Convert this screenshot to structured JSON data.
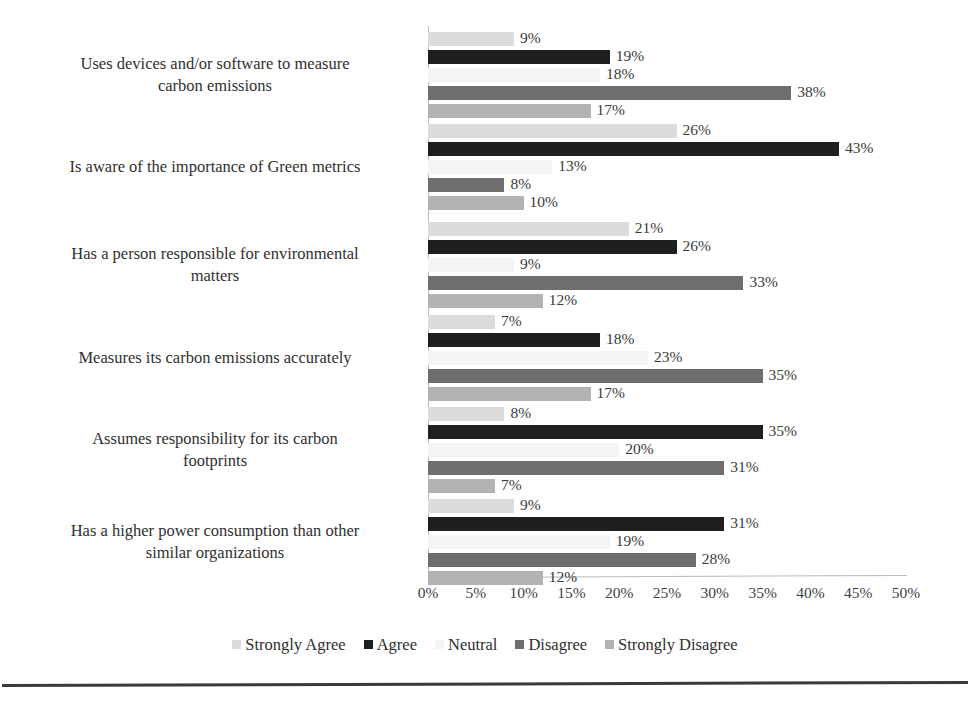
{
  "chart_data": {
    "type": "bar",
    "orientation": "horizontal",
    "title": "",
    "subtitle": "",
    "xlabel": "",
    "ylabel": "",
    "xlim": [
      0,
      50
    ],
    "xtick_labels": [
      "0%",
      "5%",
      "10%",
      "15%",
      "20%",
      "25%",
      "30%",
      "35%",
      "40%",
      "45%",
      "50%"
    ],
    "xtick_values": [
      0,
      5,
      10,
      15,
      20,
      25,
      30,
      35,
      40,
      45,
      50
    ],
    "grid": false,
    "legend_position": "bottom",
    "value_label_suffix": "%",
    "categories": [
      "Uses devices and/or software to measure carbon emissions",
      "Is aware of the importance of Green metrics",
      "Has a person responsible for environmental matters",
      "Measures its carbon emissions accurately",
      "Assumes responsibility for its carbon footprints",
      "Has a higher power consumption than other similar organizations"
    ],
    "category_lines": [
      [
        "Uses devices and/or software to measure",
        "carbon emissions"
      ],
      [
        "Is aware of the importance of Green metrics"
      ],
      [
        "Has a person responsible for environmental",
        "matters"
      ],
      [
        "Measures its carbon emissions accurately"
      ],
      [
        "Assumes responsibility for its carbon",
        "footprints"
      ],
      [
        "Has a higher power consumption than other",
        "similar organizations"
      ]
    ],
    "series": [
      {
        "name": "Strongly Agree",
        "color": "#dcdcdc",
        "values": [
          9,
          26,
          21,
          7,
          8,
          9
        ],
        "labels": [
          "9%",
          "26%",
          "21%",
          "7%",
          "8%",
          "9%"
        ]
      },
      {
        "name": "Agree",
        "color": "#1f1f1f",
        "values": [
          19,
          43,
          26,
          18,
          35,
          31
        ],
        "labels": [
          "19%",
          "43%",
          "26%",
          "18%",
          "35%",
          "31%"
        ]
      },
      {
        "name": "Neutral",
        "color": "#f4f4f4",
        "values": [
          18,
          13,
          9,
          23,
          20,
          19
        ],
        "labels": [
          "18%",
          "13%",
          "9%",
          "23%",
          "20%",
          "19%"
        ]
      },
      {
        "name": "Disagree",
        "color": "#6e6e6e",
        "values": [
          38,
          8,
          33,
          35,
          31,
          28
        ],
        "labels": [
          "38%",
          "8%",
          "33%",
          "35%",
          "31%",
          "28%"
        ]
      },
      {
        "name": "Strongly Disagree",
        "color": "#b3b3b3",
        "values": [
          17,
          10,
          12,
          17,
          7,
          12
        ],
        "labels": [
          "17%",
          "10%",
          "12%",
          "17%",
          "7%",
          "12%"
        ]
      }
    ]
  }
}
